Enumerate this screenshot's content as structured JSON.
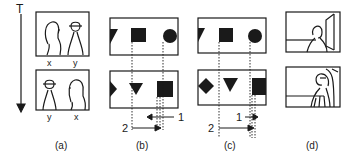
{
  "axis": {
    "label": "T",
    "direction": "down"
  },
  "panels": [
    {
      "id": "a",
      "caption": "(a)",
      "top_frame": {
        "left_label": "x",
        "right_label": "y",
        "left_figure": "woman",
        "right_figure": "man-with-hat"
      },
      "bottom_frame": {
        "left_label": "y",
        "right_label": "x",
        "left_figure": "man-with-hat",
        "right_figure": "woman"
      }
    },
    {
      "id": "b",
      "caption": "(b)",
      "top_frame": {
        "shapes": [
          "triangle-partial",
          "square",
          "circle"
        ]
      },
      "bottom_frame": {
        "shapes": [
          "triangle-partial-right",
          "triangle-down",
          "square"
        ]
      },
      "arrows": [
        {
          "label": "1",
          "direction": "left"
        },
        {
          "label": "2",
          "direction": "right"
        }
      ]
    },
    {
      "id": "c",
      "caption": "(c)",
      "top_frame": {
        "shapes": [
          "triangle-partial",
          "square",
          "circle"
        ]
      },
      "bottom_frame": {
        "shapes": [
          "diamond",
          "triangle-down",
          "square"
        ]
      },
      "arrows": [
        {
          "label": "1",
          "direction": "right"
        },
        {
          "label": "2",
          "direction": "right"
        }
      ]
    },
    {
      "id": "d",
      "caption": "(d)",
      "top_frame": {
        "content": "person-back-view-with-doorway"
      },
      "bottom_frame": {
        "content": "person-closeup-with-doorway"
      }
    }
  ],
  "colors": {
    "ink": "#1a1a1a",
    "background": "#ffffff"
  }
}
